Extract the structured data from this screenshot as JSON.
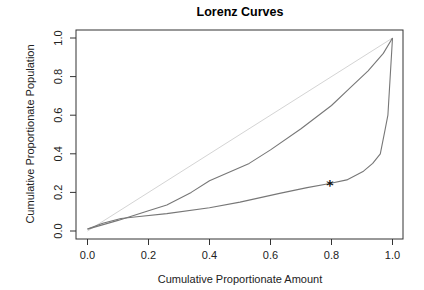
{
  "chart_data": {
    "type": "line",
    "title": "Lorenz Curves",
    "xlabel": "Cumulative Proportionate Amount",
    "ylabel": "Cumulative Proportionate Population",
    "xlim": [
      0,
      1
    ],
    "ylim": [
      0,
      1
    ],
    "x_ticks": [
      0.0,
      0.2,
      0.4,
      0.6,
      0.8,
      1.0
    ],
    "x_tick_labels": [
      "0.0",
      "0.2",
      "0.4",
      "0.6",
      "0.8",
      "1.0"
    ],
    "y_ticks": [
      0.0,
      0.2,
      0.4,
      0.6,
      0.8,
      1.0
    ],
    "y_tick_labels": [
      "0.0",
      "0.2",
      "0.4",
      "0.6",
      "0.8",
      "1.0"
    ],
    "grid": false,
    "legend": null,
    "series": [
      {
        "name": "Line of equality",
        "color": "#d4d4d4",
        "x": [
          0.0,
          1.0
        ],
        "y": [
          0.0,
          1.0
        ]
      },
      {
        "name": "Lorenz curve 1",
        "color": "#777777",
        "x": [
          0.0,
          0.1,
          0.2,
          0.26,
          0.34,
          0.4,
          0.53,
          0.6,
          0.7,
          0.8,
          0.86,
          0.92,
          0.97,
          1.0
        ],
        "y": [
          0.01,
          0.055,
          0.105,
          0.135,
          0.2,
          0.26,
          0.35,
          0.42,
          0.53,
          0.65,
          0.74,
          0.83,
          0.92,
          1.0
        ]
      },
      {
        "name": "Lorenz curve 2",
        "color": "#777777",
        "x": [
          0.0,
          0.05,
          0.11,
          0.17,
          0.26,
          0.4,
          0.5,
          0.63,
          0.72,
          0.79,
          0.85,
          0.905,
          0.935,
          0.96,
          0.975,
          0.985,
          1.0
        ],
        "y": [
          0.01,
          0.04,
          0.065,
          0.075,
          0.09,
          0.12,
          0.15,
          0.195,
          0.225,
          0.245,
          0.265,
          0.31,
          0.35,
          0.4,
          0.52,
          0.6,
          1.0
        ]
      }
    ],
    "annotations": [
      {
        "type": "marker",
        "symbol": "*",
        "x": 0.795,
        "y": 0.245
      }
    ]
  }
}
